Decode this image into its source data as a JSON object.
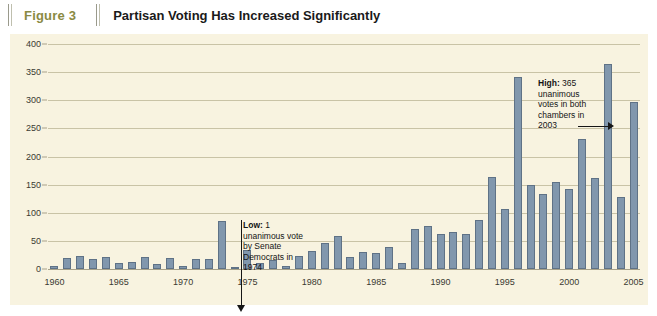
{
  "header": {
    "figure_number": "Figure 3",
    "title": "Partisan Voting Has Increased Significantly"
  },
  "colors": {
    "panel_background": "#f8f3e0",
    "bar_fill": "#8197ad",
    "bar_stroke": "#5f7286",
    "gridline": "#c9c3a6",
    "figure_number_text": "#8a8a43",
    "title_text": "#1a1a1a",
    "annotation_text": "#141414"
  },
  "annotations": [
    {
      "name": "low",
      "lines": [
        "Low: 1",
        "unanimous vote",
        "by Senate",
        "Democrats in",
        "1974"
      ],
      "bold_prefix": "Low:",
      "rest_first_line": " 1",
      "value": 1,
      "year": 1974,
      "leader": "vertical-arrow-down"
    },
    {
      "name": "high",
      "lines": [
        "High: 365",
        "unanimous",
        "votes in both",
        "chambers in",
        "2003"
      ],
      "bold_prefix": "High:",
      "rest_first_line": " 365",
      "value": 365,
      "year": 2003,
      "leader": "horizontal-arrow-right"
    }
  ],
  "chart_data": {
    "type": "bar",
    "title": "Partisan Voting Has Increased Significantly",
    "xlabel": "",
    "ylabel": "",
    "ylim": [
      0,
      400
    ],
    "yticks": [
      0,
      50,
      100,
      150,
      200,
      250,
      300,
      350,
      400
    ],
    "xticks": [
      1960,
      1965,
      1970,
      1975,
      1980,
      1985,
      1990,
      1995,
      2000,
      2005
    ],
    "xlim": [
      1959.5,
      2005.5
    ],
    "grid": true,
    "legend": "none",
    "categories": [
      1960,
      1961,
      1962,
      1963,
      1964,
      1965,
      1966,
      1967,
      1968,
      1969,
      1970,
      1971,
      1972,
      1973,
      1974,
      1975,
      1976,
      1977,
      1978,
      1979,
      1980,
      1981,
      1982,
      1983,
      1984,
      1985,
      1986,
      1987,
      1988,
      1989,
      1990,
      1991,
      1992,
      1993,
      1994,
      1995,
      1996,
      1997,
      1998,
      1999,
      2000,
      2001,
      2002,
      2003,
      2004,
      2005
    ],
    "values": [
      6,
      20,
      24,
      17,
      21,
      10,
      13,
      21,
      9,
      19,
      5,
      17,
      17,
      85,
      1,
      33,
      10,
      16,
      6,
      23,
      32,
      47,
      59,
      22,
      30,
      28,
      39,
      11,
      72,
      77,
      63,
      66,
      62,
      88,
      163,
      107,
      341,
      150,
      134,
      155,
      142,
      231,
      162,
      365,
      128,
      297
    ]
  }
}
